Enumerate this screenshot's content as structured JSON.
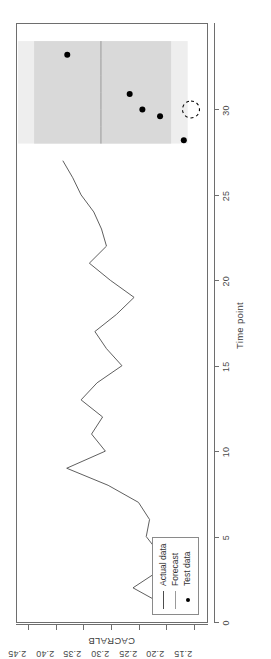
{
  "figure": {
    "rotation_degrees": -90,
    "background": "#ffffff",
    "frame_color": "#6e6e6e"
  },
  "axes": {
    "y_title": "CACRALB",
    "x_title": "Time point",
    "x_ticks": [
      "0",
      "5",
      "10",
      "15",
      "20",
      "25",
      "30"
    ],
    "y_ticks": [
      "2.15",
      "2.20",
      "2.25",
      "2.30",
      "2.35",
      "2.40",
      "2.45"
    ]
  },
  "legend": {
    "items": [
      {
        "label": "Actual data",
        "marker": "line",
        "color": "#4d4d4d"
      },
      {
        "label": "Forecast",
        "marker": "line",
        "color": "#9a9a9a"
      },
      {
        "label": "Test data",
        "marker": "dot",
        "color": "#000000"
      }
    ]
  },
  "annotation": {
    "type": "dashed-circle-highlight",
    "x": 30.0,
    "y": 2.157,
    "color": "#000000"
  },
  "chart_data": {
    "type": "line",
    "title": "",
    "subtitle": "",
    "xlabel": "Time point",
    "ylabel": "CACRALB",
    "xlim": [
      0,
      35
    ],
    "ylim": [
      2.128,
      2.472
    ],
    "grid": false,
    "legend_position": "bottom-left",
    "series": [
      {
        "name": "Actual data",
        "type": "line",
        "color": "#4d4d4d",
        "x": [
          1,
          2,
          3,
          4,
          5,
          6,
          7,
          8,
          9,
          10,
          11,
          12,
          13,
          14,
          15,
          16,
          17,
          18,
          19,
          20,
          21,
          22,
          23,
          24,
          25,
          26,
          27
        ],
        "values": [
          2.206,
          2.262,
          2.215,
          2.214,
          2.238,
          2.232,
          2.252,
          2.307,
          2.382,
          2.312,
          2.337,
          2.317,
          2.356,
          2.327,
          2.282,
          2.31,
          2.331,
          2.292,
          2.26,
          2.303,
          2.341,
          2.31,
          2.319,
          2.333,
          2.356,
          2.371,
          2.389
        ]
      },
      {
        "name": "Forecast",
        "type": "line",
        "color": "#9a9a9a",
        "x": [
          28,
          29,
          30,
          31,
          32,
          33,
          34
        ],
        "values": [
          2.32,
          2.32,
          2.32,
          2.32,
          2.32,
          2.32,
          2.32
        ]
      },
      {
        "name": "Test data",
        "type": "scatter",
        "color": "#000000",
        "x": [
          28.2,
          29.6,
          30.0,
          30.9,
          33.2
        ],
        "values": [
          2.17,
          2.213,
          2.245,
          2.268,
          2.381
        ]
      }
    ],
    "intervals": [
      {
        "name": "95% prediction interval",
        "color": "#eeeeee",
        "x": [
          28,
          34
        ],
        "lower": [
          2.163,
          2.163
        ],
        "upper": [
          2.47,
          2.47
        ]
      },
      {
        "name": "80% prediction interval",
        "color": "#d9d9d9",
        "x": [
          28,
          34
        ],
        "lower": [
          2.193,
          2.193
        ],
        "upper": [
          2.441,
          2.441
        ]
      }
    ]
  }
}
